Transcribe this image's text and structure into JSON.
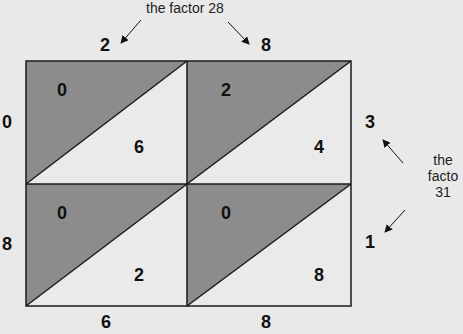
{
  "colors": {
    "background": "#e9e9e9",
    "shaded_triangle": "#8c8c8c",
    "light_triangle": "#eaeaea",
    "lines": "#1a1a1a"
  },
  "annotations": {
    "top_factor_label": "the factor 28",
    "right_factor_label_line1": "the",
    "right_factor_label_line2": "facto",
    "right_factor_label_line3": "31"
  },
  "top_digits": [
    "2",
    "8"
  ],
  "right_digits": [
    "3",
    "1"
  ],
  "left_digits": [
    "0",
    "8"
  ],
  "bottom_digits": [
    "6",
    "8"
  ],
  "cells": [
    {
      "row": 0,
      "col": 0,
      "tens": "0",
      "ones": "6"
    },
    {
      "row": 0,
      "col": 1,
      "tens": "2",
      "ones": "4"
    },
    {
      "row": 1,
      "col": 0,
      "tens": "0",
      "ones": "2"
    },
    {
      "row": 1,
      "col": 1,
      "tens": "0",
      "ones": "8"
    }
  ]
}
